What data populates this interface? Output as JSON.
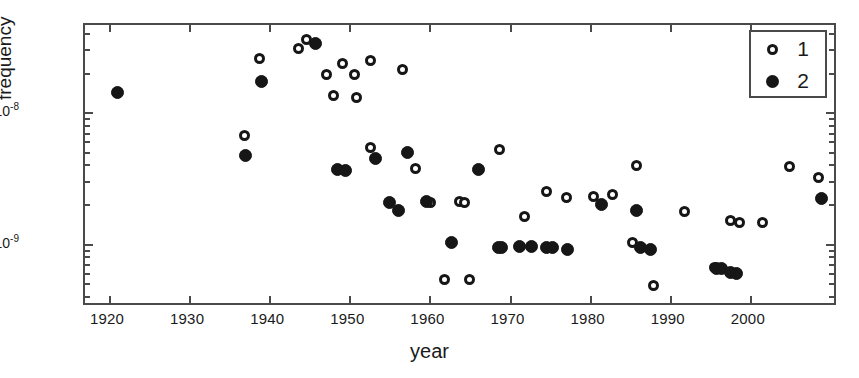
{
  "chart_data": {
    "type": "scatter",
    "title": "",
    "xlabel": "year",
    "ylabel": "frequency",
    "xlim": [
      1917,
      2011
    ],
    "ylim": [
      3.3e-10,
      4.6e-08
    ],
    "yscale": "log",
    "grid": false,
    "legend_position": "top-right",
    "x_ticks": [
      1920,
      1930,
      1940,
      1950,
      1960,
      1970,
      1980,
      1990,
      2000
    ],
    "x_tick_labels": [
      "1920",
      "1930",
      "1940",
      "1950",
      "1960",
      "1970",
      "1980",
      "1990",
      "2000"
    ],
    "y_ticks": [
      1e-08,
      1e-09
    ],
    "y_tick_labels": [
      "10-8",
      "10-9"
    ],
    "y_tick_mantissas": [
      "10",
      "10"
    ],
    "y_tick_exponents": [
      "-8",
      "-9"
    ],
    "series": [
      {
        "name": "1",
        "marker": "open-circle",
        "color": "#161616",
        "points": [
          {
            "year": 1938.8,
            "frequency": 2.55e-08
          },
          {
            "year": 1936.9,
            "frequency": 6.6e-09
          },
          {
            "year": 1943.7,
            "frequency": 3.05e-08
          },
          {
            "year": 1944.6,
            "frequency": 3.55e-08
          },
          {
            "year": 1947.1,
            "frequency": 1.95e-08
          },
          {
            "year": 1949.1,
            "frequency": 2.35e-08
          },
          {
            "year": 1950.6,
            "frequency": 1.95e-08
          },
          {
            "year": 1952.7,
            "frequency": 2.45e-08
          },
          {
            "year": 1948.0,
            "frequency": 1.35e-08
          },
          {
            "year": 1950.9,
            "frequency": 1.3e-08
          },
          {
            "year": 1956.6,
            "frequency": 2.1e-08
          },
          {
            "year": 1952.6,
            "frequency": 5.4e-09
          },
          {
            "year": 1958.2,
            "frequency": 3.7e-09
          },
          {
            "year": 1960.1,
            "frequency": 2.05e-09
          },
          {
            "year": 1963.7,
            "frequency": 2.1e-09
          },
          {
            "year": 1964.4,
            "frequency": 2.05e-09
          },
          {
            "year": 1961.9,
            "frequency": 5.3e-10
          },
          {
            "year": 1965.0,
            "frequency": 5.3e-10
          },
          {
            "year": 1968.8,
            "frequency": 5.2e-09
          },
          {
            "year": 1971.9,
            "frequency": 1.62e-09
          },
          {
            "year": 1974.6,
            "frequency": 2.5e-09
          },
          {
            "year": 1977.1,
            "frequency": 2.25e-09
          },
          {
            "year": 1980.5,
            "frequency": 2.3e-09
          },
          {
            "year": 1982.9,
            "frequency": 2.35e-09
          },
          {
            "year": 1985.9,
            "frequency": 3.95e-09
          },
          {
            "year": 1985.4,
            "frequency": 1.02e-09
          },
          {
            "year": 1988.0,
            "frequency": 4.8e-10
          },
          {
            "year": 1991.8,
            "frequency": 1.75e-09
          },
          {
            "year": 1995.6,
            "frequency": 6.6e-10
          },
          {
            "year": 1997.6,
            "frequency": 1.5e-09
          },
          {
            "year": 1998.7,
            "frequency": 1.45e-09
          },
          {
            "year": 2001.6,
            "frequency": 1.45e-09
          },
          {
            "year": 2004.9,
            "frequency": 3.85e-09
          },
          {
            "year": 2008.6,
            "frequency": 3.2e-09
          }
        ]
      },
      {
        "name": "2",
        "marker": "filled-circle",
        "color": "#161616",
        "points": [
          {
            "year": 1921.0,
            "frequency": 1.42e-08
          },
          {
            "year": 1939.0,
            "frequency": 1.72e-08
          },
          {
            "year": 1937.0,
            "frequency": 4.7e-09
          },
          {
            "year": 1945.8,
            "frequency": 3.3e-08
          },
          {
            "year": 1948.5,
            "frequency": 3.65e-09
          },
          {
            "year": 1949.5,
            "frequency": 3.6e-09
          },
          {
            "year": 1953.3,
            "frequency": 4.45e-09
          },
          {
            "year": 1957.3,
            "frequency": 4.9e-09
          },
          {
            "year": 1955.0,
            "frequency": 2.05e-09
          },
          {
            "year": 1956.1,
            "frequency": 1.8e-09
          },
          {
            "year": 1959.6,
            "frequency": 2.1e-09
          },
          {
            "year": 1962.8,
            "frequency": 1.02e-09
          },
          {
            "year": 1966.1,
            "frequency": 3.65e-09
          },
          {
            "year": 1968.6,
            "frequency": 9.3e-10
          },
          {
            "year": 1969.0,
            "frequency": 9.3e-10
          },
          {
            "year": 1971.3,
            "frequency": 9.6e-10
          },
          {
            "year": 1972.7,
            "frequency": 9.6e-10
          },
          {
            "year": 1974.6,
            "frequency": 9.3e-10
          },
          {
            "year": 1975.4,
            "frequency": 9.3e-10
          },
          {
            "year": 1977.2,
            "frequency": 9.1e-10
          },
          {
            "year": 1981.5,
            "frequency": 2e-09
          },
          {
            "year": 1985.9,
            "frequency": 1.78e-09
          },
          {
            "year": 1986.4,
            "frequency": 9.3e-10
          },
          {
            "year": 1987.6,
            "frequency": 9e-10
          },
          {
            "year": 1995.8,
            "frequency": 6.5e-10
          },
          {
            "year": 1996.4,
            "frequency": 6.5e-10
          },
          {
            "year": 1997.6,
            "frequency": 6e-10
          },
          {
            "year": 1998.3,
            "frequency": 5.9e-10
          },
          {
            "year": 2008.9,
            "frequency": 2.2e-09
          }
        ]
      }
    ]
  },
  "axes": {
    "x_title": "year",
    "y_title": "frequency"
  },
  "legend": {
    "entries": [
      {
        "label": "1",
        "marker": "open-circle"
      },
      {
        "label": "2",
        "marker": "filled-circle"
      }
    ]
  }
}
